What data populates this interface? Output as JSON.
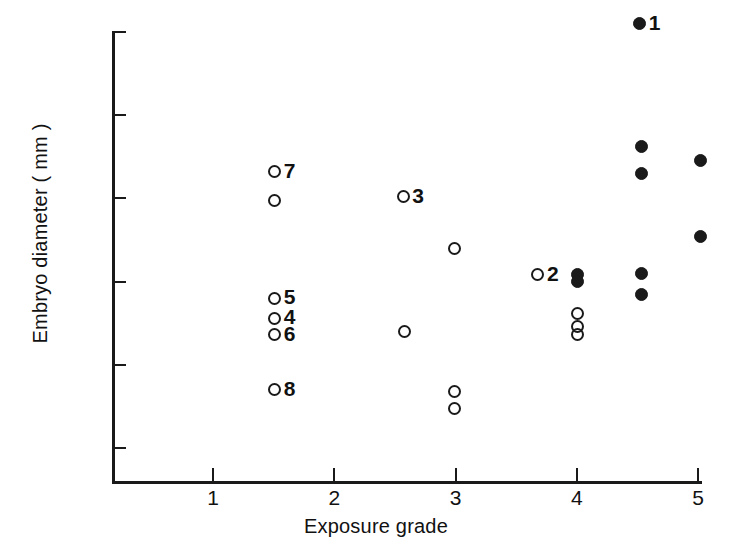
{
  "chart_data": {
    "type": "scatter",
    "title": "",
    "xlabel": "Exposure grade",
    "ylabel": "Embryo diameter ( mm )",
    "xlim": [
      0.5,
      5.2
    ],
    "ylim": [
      0.487,
      0.762
    ],
    "grid": false,
    "legend": null,
    "x_ticks": [
      1,
      2,
      3,
      4,
      5
    ],
    "x_tick_labels": [
      "1",
      "2",
      "3",
      "4",
      "5"
    ],
    "y_ticks": [
      0.5,
      0.55,
      0.6,
      0.65,
      0.7,
      0.75
    ],
    "y_tick_labels": [
      "0.500",
      "0.550",
      "0.600",
      "0.650",
      "0.700",
      "0.750"
    ],
    "series": [
      {
        "name": "open-circles",
        "marker": "open-circle",
        "color": "#1a1a1a",
        "points": [
          {
            "x": 1.51,
            "y": 0.666,
            "label": "7"
          },
          {
            "x": 1.51,
            "y": 0.649,
            "label": ""
          },
          {
            "x": 1.51,
            "y": 0.59,
            "label": "5"
          },
          {
            "x": 1.51,
            "y": 0.578,
            "label": "4"
          },
          {
            "x": 1.51,
            "y": 0.568,
            "label": "6"
          },
          {
            "x": 1.51,
            "y": 0.535,
            "label": "8"
          },
          {
            "x": 2.57,
            "y": 0.651,
            "label": "3"
          },
          {
            "x": 2.58,
            "y": 0.57,
            "label": ""
          },
          {
            "x": 2.99,
            "y": 0.62,
            "label": ""
          },
          {
            "x": 2.99,
            "y": 0.534,
            "label": ""
          },
          {
            "x": 2.99,
            "y": 0.524,
            "label": ""
          },
          {
            "x": 3.68,
            "y": 0.604,
            "label": "2"
          },
          {
            "x": 4.01,
            "y": 0.581,
            "label": ""
          },
          {
            "x": 4.01,
            "y": 0.573,
            "label": ""
          },
          {
            "x": 4.01,
            "y": 0.568,
            "label": ""
          }
        ]
      },
      {
        "name": "filled-circles",
        "marker": "filled-circle",
        "color": "#1a1a1a",
        "points": [
          {
            "x": 4.52,
            "y": 0.755,
            "label": "1"
          },
          {
            "x": 4.01,
            "y": 0.604,
            "label": ""
          },
          {
            "x": 4.01,
            "y": 0.6,
            "label": ""
          },
          {
            "x": 4.53,
            "y": 0.681,
            "label": ""
          },
          {
            "x": 4.53,
            "y": 0.665,
            "label": ""
          },
          {
            "x": 4.53,
            "y": 0.605,
            "label": ""
          },
          {
            "x": 4.53,
            "y": 0.592,
            "label": ""
          },
          {
            "x": 5.02,
            "y": 0.673,
            "label": ""
          },
          {
            "x": 5.02,
            "y": 0.627,
            "label": ""
          }
        ]
      }
    ]
  }
}
